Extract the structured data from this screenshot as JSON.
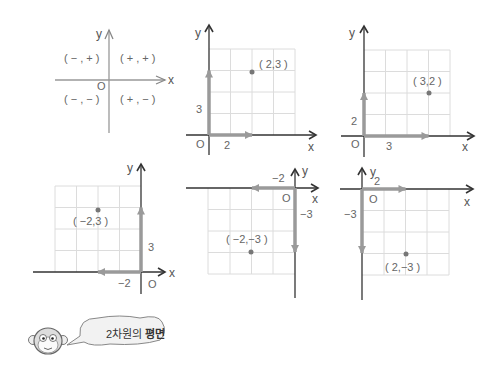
{
  "title": "2차원의 평면",
  "caption": {
    "prefix": "2차원의",
    "bold": "평면"
  },
  "colors": {
    "axis": "#333333",
    "arrow": "#9a9a9a",
    "grid": "#dcdcdc",
    "point": "#777777",
    "text": "#555555"
  },
  "panels": [
    {
      "id": "quadrants",
      "axis_x": "x",
      "axis_y": "y",
      "origin": "O",
      "quadrants": {
        "q1": "( + , + )",
        "q2": "( − , + )",
        "q3": "( − , − )",
        "q4": "( + , − )"
      }
    },
    {
      "id": "p1",
      "point_label": "( 2,3 )",
      "x_step": "2",
      "y_step": "3",
      "axis_x": "x",
      "axis_y": "y",
      "origin": "O"
    },
    {
      "id": "p2",
      "point_label": "( 3,2 )",
      "x_step": "3",
      "y_step": "2",
      "axis_x": "x",
      "axis_y": "y",
      "origin": "O"
    },
    {
      "id": "p3",
      "point_label": "( −2,3 )",
      "x_step": "−2",
      "y_step": "3",
      "axis_x": "x",
      "axis_y": "y",
      "origin": "O"
    },
    {
      "id": "p4",
      "point_label": "( −2,−3 )",
      "x_step": "−2",
      "y_step": "−3",
      "axis_x": "x",
      "axis_y": "y",
      "origin": "O"
    },
    {
      "id": "p5",
      "point_label": "( 2,−3 )",
      "x_step": "2",
      "y_step": "−3",
      "axis_x": "x",
      "axis_y": "y",
      "origin": "O"
    }
  ],
  "mascot": "monkey"
}
